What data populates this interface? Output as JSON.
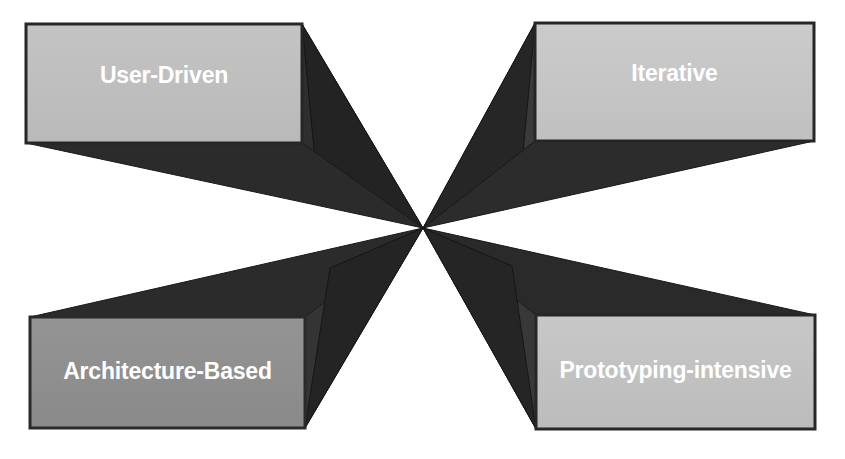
{
  "diagram": {
    "type": "four-quadrant-converging-perspective",
    "title_visible": false,
    "center_point": {
      "x": 423,
      "y": 228
    },
    "background_color": "#ffffff",
    "face_color": "#bfbfbf",
    "face_color_dark": "#8e8e8e",
    "extrusion_color": "#2b2b2b",
    "extrusion_color_alt": "#3d3d3d",
    "outline_color": "#1a1a1a",
    "label_color": "#ffffff",
    "nodes": [
      {
        "id": "user-driven",
        "label": "User-Driven",
        "position": "top-left",
        "face_color": "#bfbfbf",
        "box": {
          "x": 26,
          "y": 24,
          "width": 276,
          "height": 119
        }
      },
      {
        "id": "iterative",
        "label": "Iterative",
        "position": "top-right",
        "face_color": "#c6c6c6",
        "box": {
          "x": 535,
          "y": 23,
          "width": 279,
          "height": 118
        }
      },
      {
        "id": "architecture-based",
        "label": "Architecture-Based",
        "position": "bottom-left",
        "face_color": "#8e8e8e",
        "box": {
          "x": 30,
          "y": 317,
          "width": 275,
          "height": 111
        }
      },
      {
        "id": "prototyping-intensive",
        "label": "Prototyping-intensive",
        "position": "bottom-right",
        "face_color": "#c2c2c2",
        "box": {
          "x": 536,
          "y": 315,
          "width": 279,
          "height": 114
        }
      }
    ]
  }
}
